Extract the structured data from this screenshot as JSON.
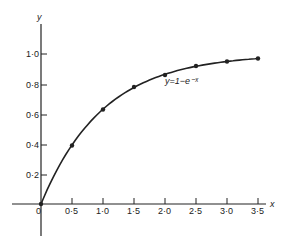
{
  "chart_data": {
    "type": "line",
    "title": "",
    "xlabel": "x",
    "ylabel": "y",
    "annotation": "y=1−e⁻ˣ",
    "x": [
      0,
      0.5,
      1.0,
      1.5,
      2.0,
      2.5,
      3.0,
      3.5
    ],
    "series": [
      {
        "name": "y=1−e⁻ˣ",
        "values": [
          0,
          0.39,
          0.63,
          0.78,
          0.86,
          0.92,
          0.95,
          0.97
        ]
      }
    ],
    "xlim": [
      -0.3,
      3.8
    ],
    "ylim": [
      -0.25,
      1.15
    ],
    "xticks": [
      "0·5",
      "1·0",
      "1·5",
      "2·0",
      "2·5",
      "3·0",
      "3·5"
    ],
    "yticks": [
      "0·2",
      "0·4",
      "0·6",
      "0·8",
      "1·0"
    ],
    "origin_label": "0",
    "grid": false,
    "markers": true
  }
}
